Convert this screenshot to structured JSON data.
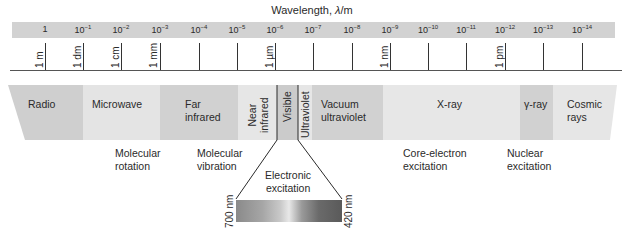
{
  "title": {
    "prefix": "Wavelength, ",
    "symbol": "λ",
    "suffix": "/m"
  },
  "scale": {
    "powers": [
      {
        "label": "1",
        "exp": "",
        "x": 45
      },
      {
        "label": "10",
        "exp": "−1",
        "x": 83
      },
      {
        "label": "10",
        "exp": "−2",
        "x": 121
      },
      {
        "label": "10",
        "exp": "−3",
        "x": 160
      },
      {
        "label": "10",
        "exp": "−4",
        "x": 199
      },
      {
        "label": "10",
        "exp": "−5",
        "x": 237
      },
      {
        "label": "10",
        "exp": "−6",
        "x": 275
      },
      {
        "label": "10",
        "exp": "−7",
        "x": 313
      },
      {
        "label": "10",
        "exp": "−8",
        "x": 352
      },
      {
        "label": "10",
        "exp": "−9",
        "x": 390
      },
      {
        "label": "10",
        "exp": "−10",
        "x": 428
      },
      {
        "label": "10",
        "exp": "−11",
        "x": 466
      },
      {
        "label": "10",
        "exp": "−12",
        "x": 505
      },
      {
        "label": "10",
        "exp": "−13",
        "x": 543
      },
      {
        "label": "10",
        "exp": "−14",
        "x": 582
      }
    ],
    "units": [
      {
        "label": "1 m",
        "x": 34
      },
      {
        "label": "1 dm",
        "x": 72
      },
      {
        "label": "1 cm",
        "x": 110
      },
      {
        "label": "1 mm",
        "x": 148
      },
      {
        "label": "1 µm",
        "x": 264
      },
      {
        "label": "1 nm",
        "x": 379
      },
      {
        "label": "1 pm",
        "x": 494
      }
    ]
  },
  "regions": [
    {
      "name": "Radio",
      "color": "#cfcfcf"
    },
    {
      "name": "Microwave",
      "color": "#e4e4e4"
    },
    {
      "name": "Far infrared",
      "line1": "Far",
      "line2": "infrared",
      "color": "#d1d1d1"
    },
    {
      "name": "Near infrared",
      "line1": "Near",
      "line2": "infrared",
      "color": "#e6e6e6"
    },
    {
      "name": "Visible",
      "color": "#cbcbcb"
    },
    {
      "name": "Ultraviolet",
      "color": "#e6e6e6"
    },
    {
      "name": "Vacuum ultraviolet",
      "line1": "Vacuum",
      "line2": "ultraviolet",
      "color": "#d1d1d1"
    },
    {
      "name": "X-ray",
      "color": "#e7e7e7"
    },
    {
      "name": "γ-ray",
      "color": "#d1d1d1"
    },
    {
      "name": "Cosmic rays",
      "line1": "Cosmic",
      "line2": "rays",
      "color": "#e6e6e6"
    }
  ],
  "processes": [
    {
      "line1": "Molecular",
      "line2": "rotation"
    },
    {
      "line1": "Molecular",
      "line2": "vibration"
    },
    {
      "line1": "Electronic",
      "line2": "excitation"
    },
    {
      "line1": "Core-electron",
      "line2": "excitation"
    },
    {
      "line1": "Nuclear",
      "line2": "excitation"
    }
  ],
  "visible_detail": {
    "left_nm": "700 nm",
    "right_nm": "420 nm"
  }
}
